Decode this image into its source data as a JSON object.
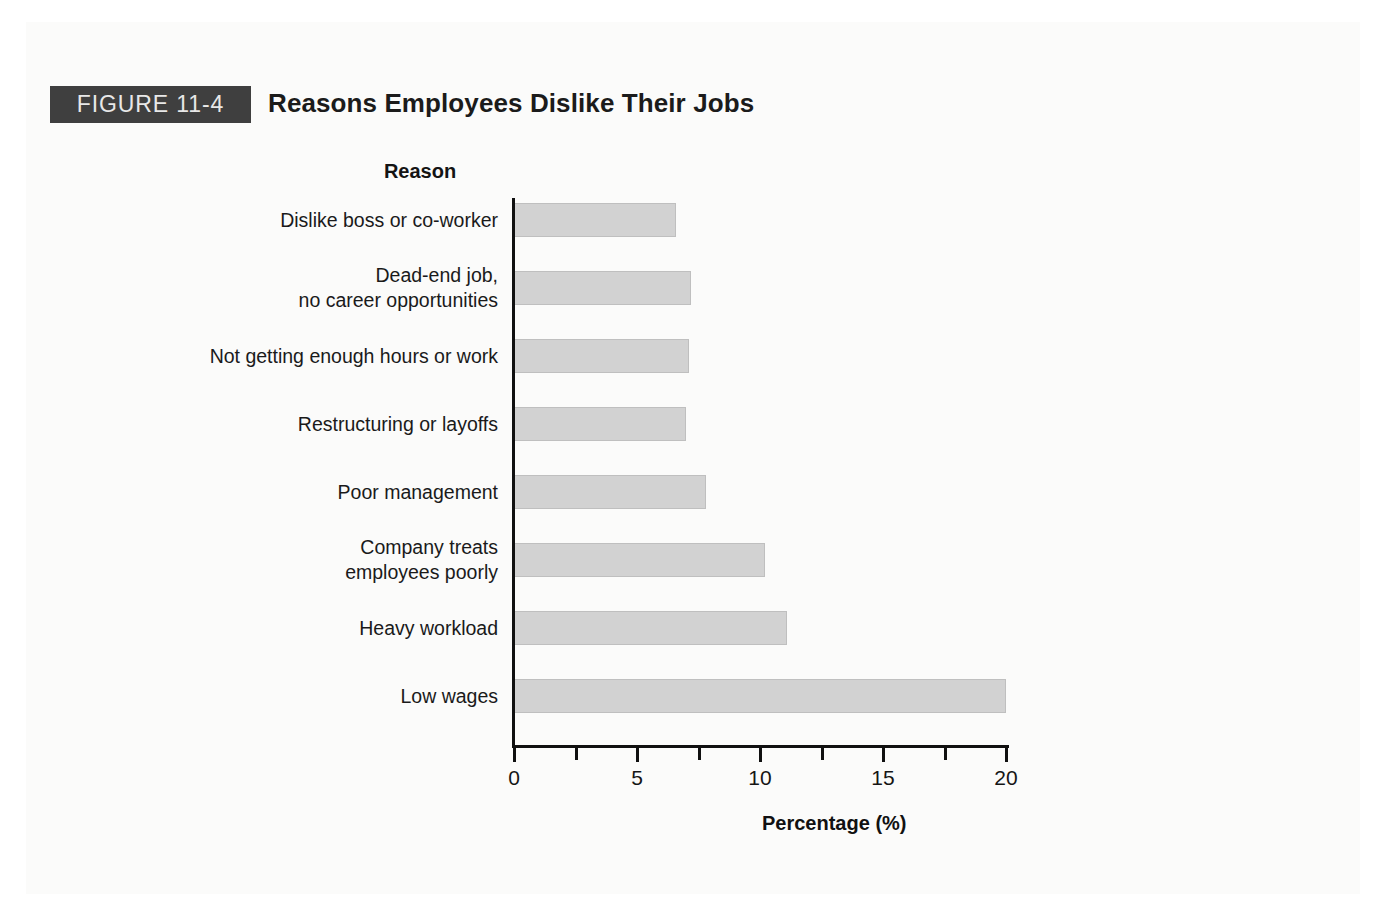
{
  "figure": {
    "badge_label": "FIGURE 11-4",
    "title": "Reasons Employees Dislike Their Jobs",
    "badge_color": "#3f3f3f",
    "badge_text_color": "#e8e8e8"
  },
  "chart_data": {
    "type": "bar",
    "orientation": "horizontal",
    "title": "Reasons Employees Dislike Their Jobs",
    "xlabel": "Percentage (%)",
    "ylabel": "Reason",
    "categories": [
      "Dislike boss or co-worker",
      "Dead-end job,\nno career opportunities",
      "Not getting enough hours or work",
      "Restructuring or layoffs",
      "Poor management",
      "Company treats\nemployees poorly",
      "Heavy workload",
      "Low wages"
    ],
    "values": [
      6.6,
      7.2,
      7.1,
      7.0,
      7.8,
      10.2,
      11.1,
      20.0
    ],
    "xlim": [
      0,
      20
    ],
    "xticks": [
      0,
      5,
      10,
      15,
      20
    ],
    "xtick_labels": [
      "0",
      "5",
      "10",
      "15",
      "20"
    ],
    "minor_xticks": [
      2.5,
      7.5,
      12.5,
      17.5
    ],
    "grid": false,
    "legend": false,
    "bar_color": "#d2d2d2",
    "bar_border_color": "#bfbfbf",
    "axis_color": "#101010"
  }
}
